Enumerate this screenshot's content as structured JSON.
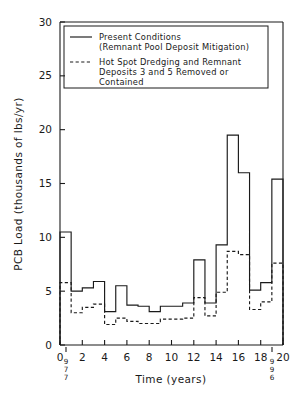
{
  "chart_data": {
    "type": "line",
    "title": "",
    "xlabel": "Time (years)",
    "ylabel": "PCB Load (thousands of lbs/yr)",
    "xlim": [
      0,
      20
    ],
    "ylim": [
      0,
      30
    ],
    "xticks": [
      0,
      2,
      4,
      6,
      8,
      10,
      12,
      14,
      16,
      18,
      20
    ],
    "yticks": [
      0,
      5,
      10,
      15,
      20,
      25,
      30
    ],
    "xtick_labels": [
      "0",
      "2",
      "4",
      "6",
      "8",
      "10",
      "12",
      "14",
      "16",
      "18",
      "20"
    ],
    "ytick_labels": [
      "0",
      "5",
      "10",
      "15",
      "20",
      "25",
      "30"
    ],
    "grid": false,
    "legend_position": "upper-left",
    "step_type": "post",
    "annotations": [
      {
        "text": "1977",
        "x": 0.2,
        "orientation": "vertical",
        "placement": "below-x-axis"
      },
      {
        "text": "1996",
        "x": 19.0,
        "orientation": "vertical",
        "placement": "below-x-axis"
      }
    ],
    "series": [
      {
        "name": "Present Conditions (Remnant Pool Deposit Mitigation)",
        "style": "solid",
        "x": [
          0,
          1,
          2,
          3,
          4,
          5,
          6,
          7,
          8,
          9,
          10,
          11,
          12,
          13,
          14,
          15,
          16,
          17,
          18,
          19,
          20
        ],
        "values": [
          10.5,
          5.0,
          5.3,
          5.9,
          3.1,
          5.5,
          3.7,
          3.6,
          3.1,
          3.6,
          3.6,
          3.9,
          7.9,
          3.9,
          9.3,
          19.5,
          16.0,
          5.1,
          5.8,
          15.4,
          15.4
        ]
      },
      {
        "name": "Hot Spot Dredging and Remnant Deposits 3 and 5 Removed or Contained",
        "style": "dashed",
        "x": [
          0,
          1,
          2,
          3,
          4,
          5,
          6,
          7,
          8,
          9,
          10,
          11,
          12,
          13,
          14,
          15,
          16,
          17,
          18,
          19,
          20
        ],
        "values": [
          5.8,
          3.0,
          3.5,
          3.8,
          1.9,
          2.5,
          2.2,
          2.0,
          2.0,
          2.4,
          2.4,
          2.5,
          4.4,
          2.7,
          4.9,
          8.7,
          8.4,
          3.3,
          4.0,
          7.6,
          7.6
        ]
      }
    ]
  },
  "legend": {
    "entries": [
      {
        "style": "solid",
        "lines": [
          "Present  Conditions",
          "(Remnant  Pool  Deposit  Mitigation)"
        ]
      },
      {
        "style": "dashed",
        "lines": [
          "Hot  Spot  Dredging  and  Remnant",
          "Deposits  3  and  5  Removed  or",
          "Contained"
        ]
      }
    ]
  },
  "axes": {
    "y_title": "PCB Load (thousands of  lbs/yr)",
    "x_title": "Time (years)"
  },
  "year_marks": {
    "left": [
      "9",
      "7",
      "7"
    ],
    "right": [
      "9",
      "9",
      "6"
    ]
  }
}
